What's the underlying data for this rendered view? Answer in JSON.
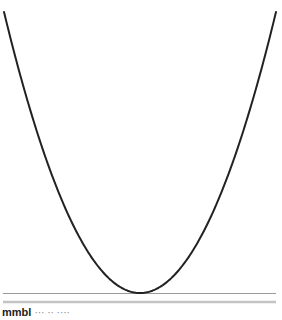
{
  "chart_data": {
    "type": "line",
    "title": "",
    "xlabel": "",
    "ylabel": "",
    "function": "y = x^2",
    "xlim": [
      -1,
      1
    ],
    "ylim": [
      0,
      1
    ],
    "grid": false,
    "series": [
      {
        "name": "parabola",
        "color": "#222222",
        "x": [
          -1.0,
          -0.9,
          -0.8,
          -0.7,
          -0.6,
          -0.5,
          -0.4,
          -0.3,
          -0.2,
          -0.1,
          0.0,
          0.1,
          0.2,
          0.3,
          0.4,
          0.5,
          0.6,
          0.7,
          0.8,
          0.9,
          1.0
        ],
        "y": [
          1.0,
          0.81,
          0.64,
          0.49,
          0.36,
          0.25,
          0.16,
          0.09,
          0.04,
          0.01,
          0.0,
          0.01,
          0.04,
          0.09,
          0.16,
          0.25,
          0.36,
          0.49,
          0.64,
          0.81,
          1.0
        ]
      }
    ],
    "baseline_color": "#9a9a9a",
    "separator_color": "#c4c4c4"
  },
  "caption": {
    "bold": "mmbl",
    "rest": "··· ·· ····"
  }
}
